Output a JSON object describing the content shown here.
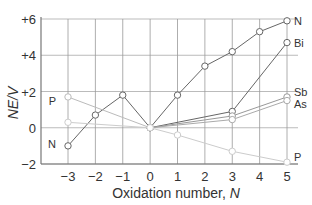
{
  "chart_data": {
    "type": "line",
    "title": "",
    "xlabel": "Oxidation number, ",
    "xlabel_italic": "N",
    "ylabel": "NE/V",
    "xlim": [
      -3,
      5
    ],
    "ylim": [
      -2,
      6
    ],
    "x_ticks": [
      -3,
      -2,
      -1,
      0,
      1,
      2,
      3,
      4,
      5
    ],
    "x_tick_labels": [
      "−3",
      "−2",
      "−1",
      "0",
      "1",
      "2",
      "3",
      "4",
      "5"
    ],
    "y_ticks": [
      -2,
      0,
      2,
      4,
      6
    ],
    "y_tick_labels": [
      "−2",
      "0",
      "+2",
      "+4",
      "+6"
    ],
    "grid": true,
    "series": [
      {
        "name": "N",
        "label_side": "both",
        "color": "#666666",
        "points": [
          [
            -3,
            -1.0
          ],
          [
            -2,
            0.7
          ],
          [
            -1,
            1.8
          ],
          [
            0,
            0
          ],
          [
            1,
            1.8
          ],
          [
            2,
            3.4
          ],
          [
            3,
            4.2
          ],
          [
            4,
            5.3
          ],
          [
            5,
            5.9
          ]
        ]
      },
      {
        "name": "Bi",
        "color": "#666666",
        "points": [
          [
            0,
            0
          ],
          [
            3,
            0.9
          ],
          [
            5,
            4.7
          ]
        ]
      },
      {
        "name": "Sb",
        "color": "#999999",
        "points": [
          [
            0,
            0
          ],
          [
            3,
            0.65
          ],
          [
            5,
            1.7
          ]
        ]
      },
      {
        "name": "As",
        "color": "#aaaaaa",
        "points": [
          [
            0,
            0
          ],
          [
            3,
            0.45
          ],
          [
            5,
            1.5
          ]
        ]
      },
      {
        "name": "P",
        "color": "#bbbbbb",
        "points": [
          [
            -3,
            1.7
          ],
          [
            0,
            0
          ]
        ]
      },
      {
        "name": "P",
        "color": "#cccccc",
        "points": [
          [
            -3,
            0.3
          ],
          [
            0,
            0
          ],
          [
            1,
            -0.4
          ],
          [
            3,
            -1.3
          ],
          [
            5,
            -1.9
          ]
        ]
      }
    ],
    "series_labels": [
      {
        "text": "N",
        "x": 5,
        "y": 5.9,
        "side": "right"
      },
      {
        "text": "Bi",
        "x": 5,
        "y": 4.7,
        "side": "right"
      },
      {
        "text": "Sb",
        "x": 5,
        "y": 1.95,
        "side": "right"
      },
      {
        "text": "As",
        "x": 5,
        "y": 1.3,
        "side": "right"
      },
      {
        "text": "P",
        "x": 5,
        "y": -1.6,
        "side": "right"
      },
      {
        "text": "P",
        "x": -3,
        "y": 1.5,
        "side": "left"
      },
      {
        "text": "N",
        "x": -3,
        "y": -0.9,
        "side": "left"
      }
    ]
  }
}
